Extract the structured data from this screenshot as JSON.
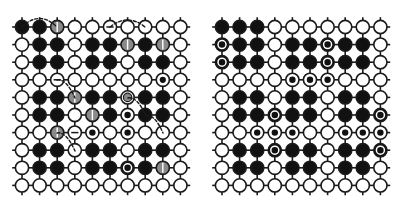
{
  "figure": {
    "title": "",
    "width": 403,
    "height": 209,
    "background": "#ffffff",
    "ink": "#1a1a1a",
    "fill_black": "#111111",
    "fill_white": "#ffffff",
    "mark_gray": "#8a8a8a"
  },
  "legend_keys": {
    "empty": "empty-cell",
    "filled": "filled-cell",
    "filled_dot": "filled-cell-with-white-dot",
    "empty_dot": "empty-cell-with-black-dot",
    "gray": "gray-marked-cell",
    "gray_ring": "gray-ring-cell",
    "bar": "empty-cell-with-bar",
    "small": "small-black-dot-cell"
  },
  "panels": [
    {
      "name": "left-panel",
      "label": "",
      "origin_x": 22,
      "origin_y": 27,
      "cols": 10,
      "rows": 10,
      "spacing": 17.6,
      "radius": 6.6,
      "annotations": [
        {
          "type": "arc",
          "name": "annotation-arc-top-left",
          "x1": 22,
          "y1": 27,
          "x2": 57,
          "y2": 27,
          "height": 17
        },
        {
          "type": "arc",
          "name": "annotation-arc-top-mid",
          "x1": 110,
          "y1": 27,
          "x2": 145,
          "y2": 27,
          "height": 14
        },
        {
          "type": "arc",
          "name": "annotation-arc-mid-left",
          "x1": 57,
          "y1": 80,
          "x2": 75,
          "y2": 98,
          "height": 11
        },
        {
          "type": "arc",
          "name": "annotation-arc-mid-right",
          "x1": 128,
          "y1": 98,
          "x2": 146,
          "y2": 116,
          "height": 11
        },
        {
          "type": "arc",
          "name": "annotation-arc-lower-left",
          "x1": 57,
          "y1": 133,
          "x2": 75,
          "y2": 151,
          "height": 11
        },
        {
          "type": "arc",
          "name": "annotation-arc-lower-right",
          "x1": 146,
          "y1": 116,
          "x2": 163,
          "y2": 133,
          "height": 11
        }
      ],
      "grid": [
        [
          "filled",
          "filled",
          "gray",
          "empty",
          "empty",
          "bar",
          "empty",
          "empty",
          "empty",
          "empty"
        ],
        [
          "empty",
          "filled",
          "filled",
          "empty",
          "filled",
          "filled",
          "gray",
          "filled",
          "gray",
          "empty"
        ],
        [
          "empty",
          "filled",
          "filled",
          "empty",
          "filled",
          "filled",
          "empty",
          "filled",
          "filled",
          "empty"
        ],
        [
          "empty",
          "empty",
          "bar",
          "empty",
          "empty",
          "empty",
          "empty",
          "empty",
          "small",
          "empty"
        ],
        [
          "empty",
          "filled",
          "filled",
          "gray",
          "filled",
          "filled",
          "gray_ring",
          "filled",
          "filled",
          "empty"
        ],
        [
          "empty",
          "filled",
          "filled",
          "empty",
          "gray",
          "filled",
          "empty_dot",
          "filled",
          "filled",
          "empty"
        ],
        [
          "empty",
          "empty",
          "gray",
          "bar",
          "empty_dot",
          "empty",
          "empty_dot",
          "empty",
          "empty",
          "empty"
        ],
        [
          "empty",
          "filled",
          "filled",
          "empty",
          "filled",
          "filled",
          "empty",
          "filled",
          "filled",
          "empty"
        ],
        [
          "empty",
          "filled",
          "filled",
          "empty",
          "filled",
          "filled",
          "filled_dot",
          "filled",
          "gray",
          "empty"
        ],
        [
          "empty",
          "empty",
          "empty",
          "empty",
          "empty",
          "empty",
          "empty",
          "empty",
          "empty",
          "empty"
        ]
      ]
    },
    {
      "name": "right-panel",
      "label": "",
      "origin_x": 222,
      "origin_y": 27,
      "cols": 10,
      "rows": 10,
      "spacing": 17.6,
      "radius": 6.6,
      "annotations": [],
      "grid": [
        [
          "filled",
          "filled",
          "filled",
          "empty",
          "empty",
          "empty",
          "empty",
          "empty",
          "empty",
          "empty"
        ],
        [
          "filled_dot",
          "filled",
          "filled",
          "empty",
          "filled",
          "filled",
          "filled_dot",
          "filled",
          "filled",
          "empty"
        ],
        [
          "filled_dot",
          "filled",
          "filled",
          "empty",
          "filled",
          "filled",
          "filled_dot",
          "filled",
          "filled",
          "empty"
        ],
        [
          "empty",
          "empty",
          "empty",
          "empty",
          "empty_dot",
          "empty_dot",
          "empty_dot",
          "empty",
          "empty",
          "empty"
        ],
        [
          "empty",
          "filled",
          "filled",
          "empty",
          "filled",
          "filled",
          "empty",
          "filled",
          "filled",
          "empty"
        ],
        [
          "empty",
          "filled",
          "filled",
          "filled_dot",
          "filled",
          "filled",
          "empty",
          "filled",
          "filled",
          "filled_dot"
        ],
        [
          "empty",
          "empty",
          "empty_dot",
          "empty_dot",
          "empty_dot",
          "empty",
          "empty",
          "empty_dot",
          "empty_dot",
          "empty_dot"
        ],
        [
          "empty",
          "filled",
          "filled",
          "filled_dot",
          "filled",
          "filled",
          "empty",
          "filled",
          "filled",
          "filled_dot"
        ],
        [
          "empty",
          "filled",
          "filled",
          "empty",
          "filled",
          "filled",
          "empty",
          "filled",
          "filled",
          "empty"
        ],
        [
          "empty",
          "empty",
          "empty",
          "empty",
          "empty",
          "empty",
          "empty",
          "empty",
          "empty",
          "empty"
        ]
      ]
    }
  ]
}
